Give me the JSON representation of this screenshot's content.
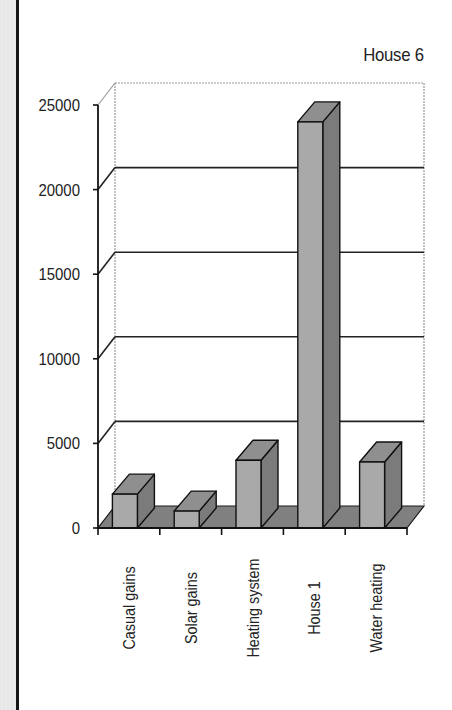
{
  "chart_data": {
    "type": "bar",
    "style": "3d-column",
    "title": "House 6",
    "xlabel": "",
    "ylabel": "",
    "categories": [
      "Casual gains",
      "Solar gains",
      "Heating system",
      "House 1",
      "Water heating"
    ],
    "values": [
      2000,
      1000,
      4000,
      24000,
      3900
    ],
    "ylim": [
      0,
      25000
    ],
    "yticks": [
      0,
      5000,
      10000,
      15000,
      20000,
      25000
    ],
    "ytick_labels": [
      "0",
      "5000",
      "10000",
      "15000",
      "20000",
      "25000"
    ],
    "grid": true,
    "legend": null
  },
  "colors": {
    "bar_front": "#a9a9a9",
    "bar_side": "#7b7b7b",
    "bar_top": "#8f8f8f",
    "floor": "#808080",
    "gridline": "#222222",
    "wall_edge": "#9a9a9a",
    "axis": "#111111"
  }
}
